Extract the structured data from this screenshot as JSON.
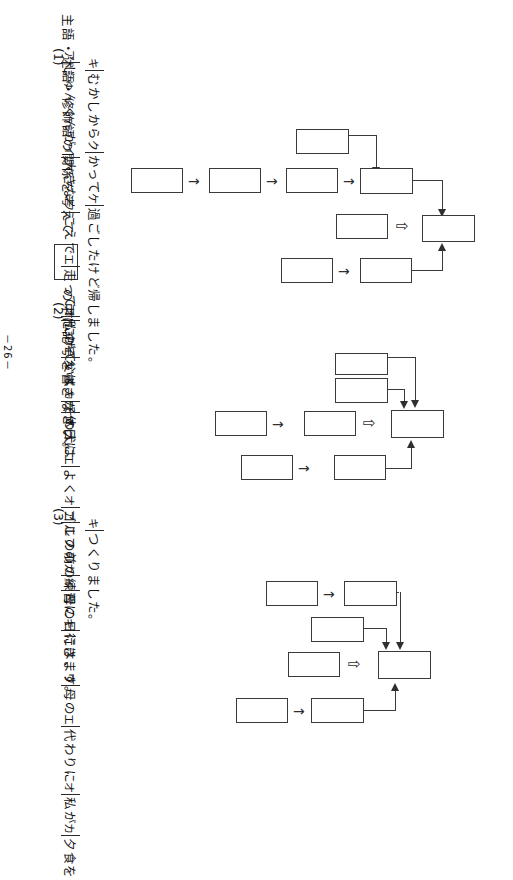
{
  "page": {
    "number_label": "－26－",
    "orientation_note": "vertical-japanese-rotated-90ccw"
  },
  "header": {
    "text_before_box": "主語・述語・修飾語の関係を考えて",
    "text_after_box": "の中に記号を書きなさい。",
    "answer_box": ""
  },
  "questions": [
    {
      "number": "(1)",
      "segments": [
        {
          "mark": "ア",
          "text": "じゅんくんが"
        },
        {
          "mark": "イ",
          "text": "大きな"
        },
        {
          "mark": "ウ",
          "text": "こえで"
        },
        {
          "mark": "エ",
          "text": "走って"
        },
        {
          "mark": "オ",
          "text": "にげていく"
        },
        {
          "mark": "カ",
          "text": "その犬は"
        },
        {
          "mark": "キ",
          "text": "むかしから"
        },
        {
          "mark": "ク",
          "text": "かって"
        },
        {
          "mark": "ケ",
          "text": "過ごしたけど帰しました。"
        }
      ]
    },
    {
      "number": "(2)",
      "segments": [
        {
          "mark": "ア",
          "text": "私の"
        },
        {
          "mark": "イ",
          "text": "父は、"
        },
        {
          "mark": "ウ",
          "text": "休日に"
        },
        {
          "mark": "エ",
          "text": "よく"
        },
        {
          "mark": "オ",
          "text": "ゴルフの"
        },
        {
          "mark": "カ",
          "text": "練習に"
        },
        {
          "mark": "キ",
          "text": "行きます。"
        }
      ]
    },
    {
      "number": "(3)",
      "segments": [
        {
          "mark": "ア",
          "text": "この前の"
        },
        {
          "mark": "イ",
          "text": "母の日には、"
        },
        {
          "mark": "ウ",
          "text": "母の"
        },
        {
          "mark": "エ",
          "text": "代わりに"
        },
        {
          "mark": "オ",
          "text": "私が"
        },
        {
          "mark": "カ",
          "text": "夕食を"
        },
        {
          "mark": "キ",
          "text": "つくりました。"
        }
      ]
    }
  ],
  "diagrams": [
    {
      "name": "diagram-1",
      "boxes": [
        "",
        "",
        "",
        "",
        "",
        "",
        "",
        "",
        ""
      ],
      "connector_glyph": "⇨"
    },
    {
      "name": "diagram-2",
      "boxes": [
        "",
        "",
        "",
        "",
        "",
        "",
        ""
      ],
      "connector_glyph": "⇨"
    },
    {
      "name": "diagram-3",
      "boxes": [
        "",
        "",
        "",
        "",
        "",
        "",
        ""
      ],
      "connector_glyph": "⇨"
    }
  ],
  "colors": {
    "ink": "#2f2f2f",
    "paper": "#ffffff"
  }
}
